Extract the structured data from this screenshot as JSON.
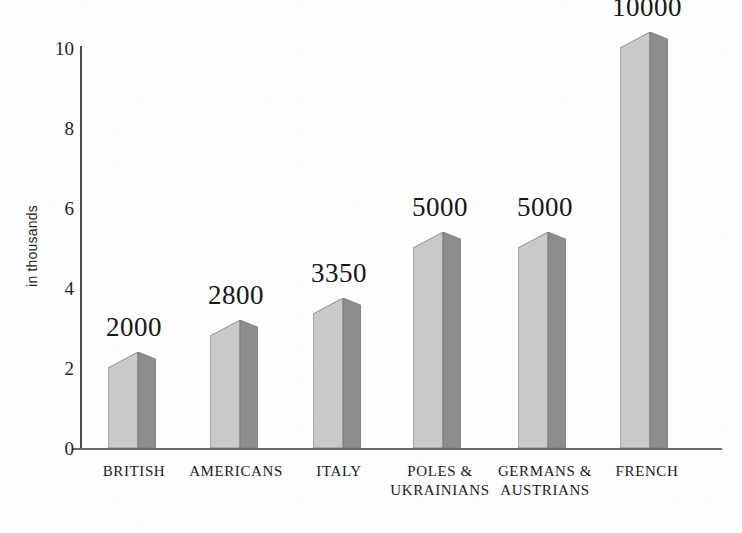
{
  "chart_data": {
    "type": "bar",
    "title": "",
    "subtitle": "",
    "xlabel": "",
    "ylabel": "in thousands",
    "ylim": [
      0,
      10
    ],
    "yticks": [
      0,
      2,
      4,
      6,
      8,
      10
    ],
    "grid": false,
    "legend": null,
    "units": "thousands",
    "categories": [
      "BRITISH",
      "AMERICANS",
      "ITALY",
      "POLES & UKRAINIANS",
      "GERMANS & AUSTRIANS",
      "FRENCH"
    ],
    "category_lines": [
      [
        "BRITISH"
      ],
      [
        "AMERICANS"
      ],
      [
        "ITALY"
      ],
      [
        "POLES &",
        "UKRAINIANS"
      ],
      [
        "GERMANS &",
        "AUSTRIANS"
      ],
      [
        "FRENCH"
      ]
    ],
    "values": [
      2000,
      2800,
      3350,
      5000,
      5000,
      10000
    ],
    "values_in_thousands": [
      2.0,
      2.8,
      3.35,
      5.0,
      5.0,
      10.0
    ],
    "data_labels": [
      "2000",
      "2800",
      "3350",
      "5000",
      "5000",
      "10000"
    ],
    "bars": [
      {
        "category": "BRITISH",
        "label": "2000",
        "value": 2000,
        "thousands": 2.0
      },
      {
        "category": "AMERICANS",
        "label": "2800",
        "value": 2800,
        "thousands": 2.8
      },
      {
        "category": "ITALY",
        "label": "3350",
        "value": 3350,
        "thousands": 3.35
      },
      {
        "category": "POLES & UKRAINIANS",
        "label": "5000",
        "value": 5000,
        "thousands": 5.0
      },
      {
        "category": "GERMANS & AUSTRIANS",
        "label": "5000",
        "value": 5000,
        "thousands": 5.0
      },
      {
        "category": "FRENCH",
        "label": "10000",
        "value": 10000,
        "thousands": 10.0
      }
    ]
  },
  "colors": {
    "background": "#fdfdfd",
    "bar_front_light": "#c9c9c9",
    "bar_side_dark": "#8d8d8d",
    "bar_top_light": "#d6d6d6",
    "bar_top_dark": "#9a9a9a",
    "bar_outline": "#7a7a7a",
    "axis": "#4a4a4a",
    "text": "#1a1a1a"
  },
  "axis": {
    "y_tick_labels": [
      "10",
      "8",
      "6",
      "4",
      "2",
      "0"
    ],
    "y_title": "in thousands"
  }
}
